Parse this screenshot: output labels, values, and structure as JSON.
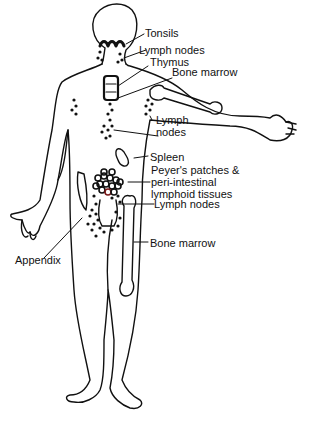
{
  "diagram": {
    "title": "",
    "colors": {
      "line": "#111111",
      "background": "#ffffff",
      "accent_dot": "#7a1a1a"
    },
    "labels": [
      {
        "id": "tonsils",
        "text": "Tonsils"
      },
      {
        "id": "lymph-nodes-neck",
        "text": "Lymph nodes"
      },
      {
        "id": "thymus",
        "text": "Thymus"
      },
      {
        "id": "bone-marrow-arm",
        "text": "Bone marrow"
      },
      {
        "id": "lymph-nodes-axillary",
        "text": "Lymph\nnodes"
      },
      {
        "id": "spleen",
        "text": "Spleen"
      },
      {
        "id": "peyers-patches",
        "text": "Peyer's patches &\nperi-intestinal\nlymphoid tissues"
      },
      {
        "id": "lymph-nodes-inguinal",
        "text": "Lymph nodes"
      },
      {
        "id": "bone-marrow-leg",
        "text": "Bone marrow"
      },
      {
        "id": "appendix",
        "text": "Appendix"
      }
    ]
  }
}
